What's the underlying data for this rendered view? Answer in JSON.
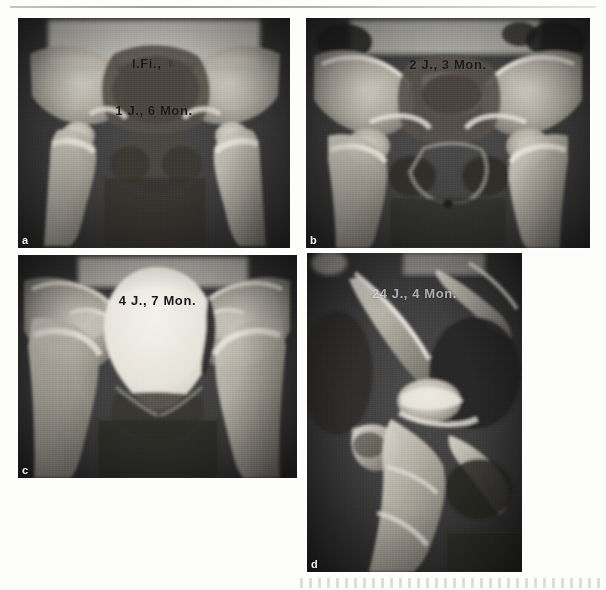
{
  "figure": {
    "kind": "radiograph-series",
    "panel_count": 4,
    "background_color": "#fdfdfc",
    "film_dark_color": "#3a3a3a",
    "bone_bright_color": "#e8e6df",
    "caption_text_color": "#17181a"
  },
  "panels": [
    {
      "letter": "a",
      "patient_label": "I.Fi., ♀",
      "age_label": "1 J., 6 Mon.",
      "caption_faded": false,
      "letter_on_dark": true
    },
    {
      "letter": "b",
      "patient_label": "",
      "age_label": "2 J., 3 Mon.",
      "caption_faded": false,
      "letter_on_dark": true
    },
    {
      "letter": "c",
      "patient_label": "",
      "age_label": "4 J., 7 Mon.",
      "caption_faded": false,
      "letter_on_dark": true
    },
    {
      "letter": "d",
      "patient_label": "",
      "age_label": "24 J., 4 Mon.",
      "caption_faded": true,
      "letter_on_dark": true
    }
  ]
}
